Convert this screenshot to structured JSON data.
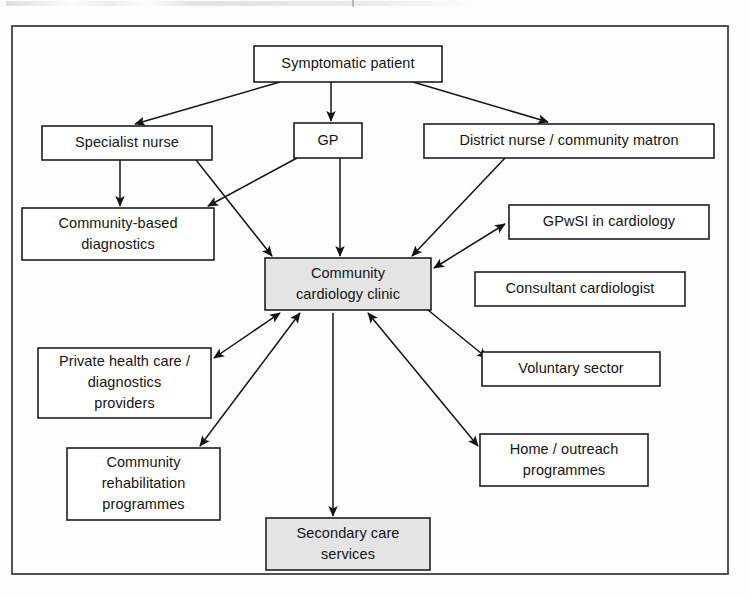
{
  "figure": {
    "frame": {
      "x": 12,
      "y": 26,
      "width": 716,
      "height": 548
    }
  },
  "colors": {
    "box_fill_plain": "#ffffff",
    "box_fill_shaded": "#e4e4e4",
    "stroke": "#141416",
    "frame_stroke": "#35363a",
    "text": "#141416"
  },
  "chart_data": {
    "type": "diagram",
    "nodes": [
      {
        "id": "symptomatic-patient",
        "label": "Symptomatic patient",
        "lines": [
          "Symptomatic patient"
        ],
        "x": 254,
        "y": 46,
        "w": 188,
        "h": 36,
        "fill": "plain"
      },
      {
        "id": "specialist-nurse",
        "label": "Specialist nurse",
        "lines": [
          "Specialist nurse"
        ],
        "x": 42,
        "y": 126,
        "w": 170,
        "h": 34,
        "fill": "plain"
      },
      {
        "id": "gp",
        "label": "GP",
        "lines": [
          "GP"
        ],
        "x": 294,
        "y": 123,
        "w": 68,
        "h": 35,
        "fill": "plain"
      },
      {
        "id": "district-nurse",
        "label": "District nurse / community matron",
        "lines": [
          "District nurse / community matron"
        ],
        "x": 424,
        "y": 124,
        "w": 290,
        "h": 34,
        "fill": "plain"
      },
      {
        "id": "community-based-diagnostics",
        "label": "Community-based diagnostics",
        "lines": [
          "Community-based",
          "diagnostics"
        ],
        "x": 22,
        "y": 208,
        "w": 192,
        "h": 52,
        "fill": "plain"
      },
      {
        "id": "gpwsi-in-cardiology",
        "label": "GPwSI in cardiology",
        "lines": [
          "GPwSI in cardiology"
        ],
        "x": 509,
        "y": 205,
        "w": 200,
        "h": 34,
        "fill": "plain"
      },
      {
        "id": "community-cardiology-clinic",
        "label": "Community cardiology clinic",
        "lines": [
          "Community",
          "cardiology clinic"
        ],
        "x": 265,
        "y": 258,
        "w": 166,
        "h": 52,
        "fill": "shaded"
      },
      {
        "id": "consultant-cardiologist",
        "label": "Consultant cardiologist",
        "lines": [
          "Consultant cardiologist"
        ],
        "x": 475,
        "y": 272,
        "w": 210,
        "h": 34,
        "fill": "plain"
      },
      {
        "id": "private-health-care",
        "label": "Private health care / diagnostics providers",
        "lines": [
          "Private health care /",
          "diagnostics",
          "providers"
        ],
        "x": 38,
        "y": 348,
        "w": 173,
        "h": 70,
        "fill": "plain"
      },
      {
        "id": "voluntary-sector",
        "label": "Voluntary sector",
        "lines": [
          "Voluntary sector"
        ],
        "x": 482,
        "y": 352,
        "w": 178,
        "h": 34,
        "fill": "plain"
      },
      {
        "id": "home-outreach-programmes",
        "label": "Home / outreach programmes",
        "lines": [
          "Home / outreach",
          "programmes"
        ],
        "x": 480,
        "y": 434,
        "w": 168,
        "h": 52,
        "fill": "plain"
      },
      {
        "id": "community-rehabilitation",
        "label": "Community rehabilitation programmes",
        "lines": [
          "Community",
          "rehabilitation",
          "programmes"
        ],
        "x": 67,
        "y": 448,
        "w": 153,
        "h": 72,
        "fill": "plain"
      },
      {
        "id": "secondary-care-services",
        "label": "Secondary care services",
        "lines": [
          "Secondary care",
          "services"
        ],
        "x": 266,
        "y": 518,
        "w": 164,
        "h": 52,
        "fill": "shaded"
      }
    ],
    "edges": [
      {
        "id": "patient-to-specialist-nurse",
        "from": "symptomatic-patient",
        "to": "specialist-nurse",
        "x1": 280,
        "y1": 82,
        "x2": 135,
        "y2": 124,
        "arrow": "forward"
      },
      {
        "id": "patient-to-gp",
        "from": "symptomatic-patient",
        "to": "gp",
        "x1": 331,
        "y1": 82,
        "x2": 331,
        "y2": 121,
        "arrow": "forward"
      },
      {
        "id": "patient-to-district-nurse",
        "from": "symptomatic-patient",
        "to": "district-nurse",
        "x1": 413,
        "y1": 82,
        "x2": 548,
        "y2": 122,
        "arrow": "forward"
      },
      {
        "id": "specialist-nurse-to-diagnostics",
        "from": "specialist-nurse",
        "to": "community-based-diagnostics",
        "x1": 120,
        "y1": 160,
        "x2": 120,
        "y2": 206,
        "arrow": "forward"
      },
      {
        "id": "specialist-nurse-to-clinic",
        "from": "specialist-nurse",
        "to": "community-cardiology-clinic",
        "x1": 196,
        "y1": 160,
        "x2": 272,
        "y2": 256,
        "arrow": "forward"
      },
      {
        "id": "gp-to-diagnostics",
        "from": "gp",
        "to": "community-based-diagnostics",
        "x1": 297,
        "y1": 158,
        "x2": 208,
        "y2": 206,
        "arrow": "forward"
      },
      {
        "id": "gp-to-clinic",
        "from": "gp",
        "to": "community-cardiology-clinic",
        "x1": 340,
        "y1": 158,
        "x2": 340,
        "y2": 256,
        "arrow": "forward"
      },
      {
        "id": "district-nurse-to-clinic",
        "from": "district-nurse",
        "to": "community-cardiology-clinic",
        "x1": 505,
        "y1": 158,
        "x2": 412,
        "y2": 256,
        "arrow": "forward"
      },
      {
        "id": "clinic-to-gpwsi",
        "from": "community-cardiology-clinic",
        "to": "gpwsi-in-cardiology",
        "x1": 434,
        "y1": 268,
        "x2": 505,
        "y2": 224,
        "arrow": "both"
      },
      {
        "id": "clinic-to-private-health-care",
        "from": "community-cardiology-clinic",
        "to": "private-health-care",
        "x1": 280,
        "y1": 313,
        "x2": 214,
        "y2": 358,
        "arrow": "both"
      },
      {
        "id": "clinic-to-rehabilitation",
        "from": "community-cardiology-clinic",
        "to": "community-rehabilitation",
        "x1": 300,
        "y1": 313,
        "x2": 200,
        "y2": 446,
        "arrow": "both"
      },
      {
        "id": "clinic-to-secondary-care",
        "from": "community-cardiology-clinic",
        "to": "secondary-care-services",
        "x1": 333,
        "y1": 313,
        "x2": 333,
        "y2": 516,
        "arrow": "forward"
      },
      {
        "id": "clinic-to-home-outreach",
        "from": "community-cardiology-clinic",
        "to": "home-outreach-programmes",
        "x1": 368,
        "y1": 313,
        "x2": 478,
        "y2": 446,
        "arrow": "both"
      },
      {
        "id": "clinic-to-voluntary-sector",
        "from": "community-cardiology-clinic",
        "to": "voluntary-sector",
        "x1": 428,
        "y1": 310,
        "x2": 487,
        "y2": 358,
        "arrow": "forward"
      }
    ]
  }
}
